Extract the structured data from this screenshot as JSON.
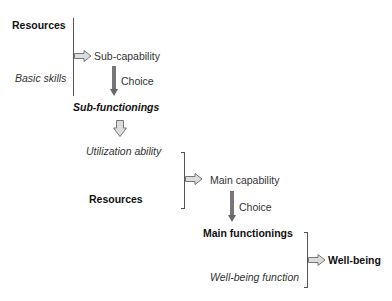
{
  "diagram": {
    "stage1": {
      "resources": "Resources",
      "basic_skills": "Basic skills",
      "sub_capability": "Sub-capability",
      "choice": "Choice",
      "sub_functionings": "Sub-functionings"
    },
    "stage2": {
      "utilization_ability": "Utilization ability",
      "resources": "Resources",
      "main_capability": "Main capability",
      "choice": "Choice",
      "main_functionings": "Main functionings"
    },
    "stage3": {
      "well_being_function": "Well-being function",
      "well_being": "Well-being"
    },
    "colors": {
      "hollow_arrow_fill": "#dcdcdc",
      "hollow_arrow_stroke": "#777777",
      "solid_arrow": "#777777",
      "bracket": "#555555"
    }
  }
}
